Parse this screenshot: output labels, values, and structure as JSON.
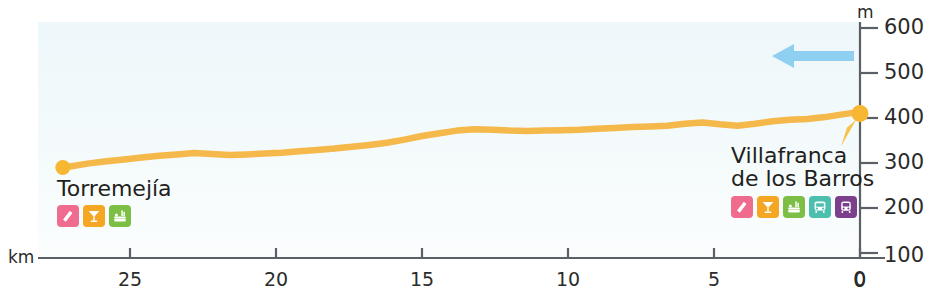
{
  "chart_data": {
    "type": "line",
    "title": "",
    "xlabel": "km",
    "ylabel": "m",
    "xlim": [
      28.5,
      0
    ],
    "ylim": [
      100,
      600
    ],
    "x_ticks": [
      25,
      20,
      15,
      10,
      5,
      0
    ],
    "y_ticks": [
      100,
      200,
      300,
      400,
      500,
      600
    ],
    "x_unit": "km",
    "y_unit": "m",
    "grid": false,
    "direction": "right-to-left",
    "series": [
      {
        "name": "Elevation profile Torremejía - Villafranca de los Barros",
        "color": "#f5b84a",
        "x": [
          27.3,
          27.0,
          26.4,
          25.8,
          25.2,
          24.6,
          24.0,
          23.4,
          22.8,
          22.2,
          21.6,
          21.0,
          20.4,
          19.8,
          19.2,
          18.6,
          18.0,
          17.4,
          16.8,
          16.2,
          15.6,
          15.0,
          14.4,
          13.8,
          13.2,
          12.6,
          12.0,
          11.4,
          10.8,
          10.2,
          9.6,
          9.0,
          8.4,
          7.8,
          7.2,
          6.6,
          6.0,
          5.4,
          4.8,
          4.2,
          3.6,
          3.0,
          2.4,
          1.8,
          1.2,
          0.6,
          0.2,
          0.0
        ],
        "y": [
          290,
          293,
          299,
          304,
          308,
          312,
          316,
          319,
          322,
          320,
          318,
          319,
          321,
          323,
          326,
          329,
          332,
          336,
          340,
          345,
          352,
          360,
          366,
          372,
          375,
          374,
          372,
          371,
          372,
          373,
          374,
          376,
          378,
          380,
          381,
          383,
          387,
          390,
          386,
          383,
          387,
          393,
          396,
          398,
          402,
          408,
          412,
          410
        ]
      }
    ],
    "markers": [
      {
        "name": "Torremejía",
        "km": 27.3,
        "m": 290
      },
      {
        "name": "Villafranca de los Barros",
        "km": 0.0,
        "m": 410
      }
    ],
    "annotations": [
      {
        "name": "direction-arrow",
        "label": "travel direction (east to west / decreasing km)",
        "color": "#8ecff2"
      }
    ]
  },
  "axis": {
    "y_unit": "m",
    "x_unit": "km",
    "y_ticks": [
      "600",
      "500",
      "400",
      "300",
      "200",
      "100"
    ],
    "y_zero": "0",
    "x_ticks": [
      "25",
      "20",
      "15",
      "10",
      "5",
      "0"
    ]
  },
  "towns": {
    "left": {
      "name": "Torremejía",
      "name_line1": "Torremejía",
      "name_line2": "",
      "icons": [
        {
          "key": "lodging-icon",
          "label": "albergue / lodging",
          "color": "#f06c8e"
        },
        {
          "key": "bar-icon",
          "label": "bar / restaurant",
          "color": "#f5a623"
        },
        {
          "key": "picnic-icon",
          "label": "picnic / rest area",
          "color": "#7dbf45"
        }
      ]
    },
    "right": {
      "name": "Villafranca de los Barros",
      "name_line1": "Villafranca",
      "name_line2": "de los Barros",
      "icons": [
        {
          "key": "lodging-icon",
          "label": "albergue / lodging",
          "color": "#f06c8e"
        },
        {
          "key": "bar-icon",
          "label": "bar / restaurant",
          "color": "#f5a623"
        },
        {
          "key": "picnic-icon",
          "label": "picnic / rest area",
          "color": "#7dbf45"
        },
        {
          "key": "bus-icon",
          "label": "bus station",
          "color": "#4cbfae"
        },
        {
          "key": "train-icon",
          "label": "train station",
          "color": "#7b3f8c"
        }
      ]
    }
  },
  "colors": {
    "profile_line": "#f5b84a",
    "marker_dot": "#f7b733",
    "arrow": "#8ecff2",
    "axis": "#5a6066",
    "text": "#231f20",
    "panel_top": "#eef7fa",
    "panel_bottom": "#fbfdfd"
  }
}
